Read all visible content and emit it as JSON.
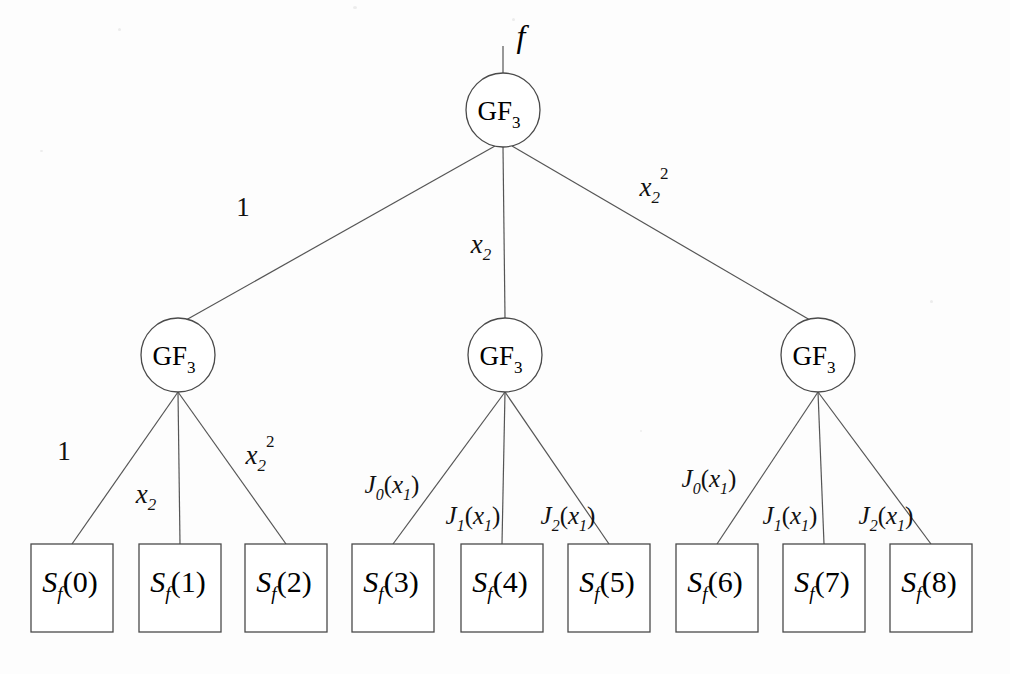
{
  "diagram": {
    "background_color": "#fdfdfd",
    "line_color": "#555555",
    "text_color": "#000000",
    "root_input_label": "f",
    "nodes": {
      "root": {
        "name": "GF",
        "subscript": "3",
        "cx": 503,
        "cy": 110,
        "r": 37
      },
      "level2": [
        {
          "name": "GF",
          "subscript": "3",
          "cx": 178,
          "cy": 355,
          "r": 37
        },
        {
          "name": "GF",
          "subscript": "3",
          "cx": 505,
          "cy": 355,
          "r": 37
        },
        {
          "name": "GF",
          "subscript": "3",
          "cx": 818,
          "cy": 355,
          "r": 37
        }
      ]
    },
    "root_edge_labels": [
      {
        "text": "1",
        "base": "1",
        "sub": "",
        "sup": "",
        "x": 243,
        "y": 216
      },
      {
        "text": "x2",
        "base": "x",
        "sub": "2",
        "sup": "",
        "x": 481,
        "y": 253
      },
      {
        "text": "x2^2",
        "base": "x",
        "sub": "2",
        "sup": "2",
        "x": 654,
        "y": 196
      }
    ],
    "branch_edge_labels": [
      [
        {
          "base": "1",
          "sub": "",
          "sup": "",
          "x": 64,
          "y": 460
        },
        {
          "base": "x",
          "sub": "2",
          "sup": "",
          "x": 146,
          "y": 503
        },
        {
          "base": "x",
          "sub": "2",
          "sup": "2",
          "x": 260,
          "y": 464
        }
      ],
      [
        {
          "base": "J",
          "fsub": "0",
          "arg": "x",
          "argsub": "1",
          "x": 392,
          "y": 493
        },
        {
          "base": "J",
          "fsub": "1",
          "arg": "x",
          "argsub": "1",
          "x": 473,
          "y": 524
        },
        {
          "base": "J",
          "fsub": "2",
          "arg": "x",
          "argsub": "1",
          "x": 568,
          "y": 524
        }
      ],
      [
        {
          "base": "J",
          "fsub": "0",
          "arg": "x",
          "argsub": "1",
          "x": 709,
          "y": 487
        },
        {
          "base": "J",
          "fsub": "1",
          "arg": "x",
          "argsub": "1",
          "x": 790,
          "y": 524
        },
        {
          "base": "J",
          "fsub": "2",
          "arg": "x",
          "argsub": "1",
          "x": 886,
          "y": 524
        }
      ]
    ],
    "leaves": [
      {
        "base": "S",
        "sub": "f",
        "arg": "(0)",
        "x": 31,
        "y": 544,
        "w": 82,
        "h": 88
      },
      {
        "base": "S",
        "sub": "f",
        "arg": "(1)",
        "x": 139,
        "y": 544,
        "w": 82,
        "h": 88
      },
      {
        "base": "S",
        "sub": "f",
        "arg": "(2)",
        "x": 245,
        "y": 544,
        "w": 82,
        "h": 88
      },
      {
        "base": "S",
        "sub": "f",
        "arg": "(3)",
        "x": 352,
        "y": 544,
        "w": 82,
        "h": 88
      },
      {
        "base": "S",
        "sub": "f",
        "arg": "(4)",
        "x": 461,
        "y": 544,
        "w": 82,
        "h": 88
      },
      {
        "base": "S",
        "sub": "f",
        "arg": "(5)",
        "x": 568,
        "y": 544,
        "w": 82,
        "h": 88
      },
      {
        "base": "S",
        "sub": "f",
        "arg": "(6)",
        "x": 676,
        "y": 544,
        "w": 82,
        "h": 88
      },
      {
        "base": "S",
        "sub": "f",
        "arg": "(7)",
        "x": 783,
        "y": 544,
        "w": 82,
        "h": 88
      },
      {
        "base": "S",
        "sub": "f",
        "arg": "(8)",
        "x": 890,
        "y": 544,
        "w": 82,
        "h": 88
      }
    ]
  }
}
